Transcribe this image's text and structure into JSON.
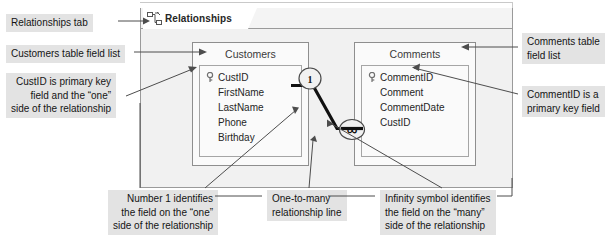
{
  "window": {
    "tab": {
      "label": "Relationships",
      "icon": "relationships-icon"
    }
  },
  "tables": [
    {
      "name": "Customers",
      "fields": [
        {
          "label": "CustID",
          "primary_key": true
        },
        {
          "label": "FirstName",
          "primary_key": false
        },
        {
          "label": "LastName",
          "primary_key": false
        },
        {
          "label": "Phone",
          "primary_key": false
        },
        {
          "label": "Birthday",
          "primary_key": false
        }
      ]
    },
    {
      "name": "Comments",
      "fields": [
        {
          "label": "CommentID",
          "primary_key": true
        },
        {
          "label": "Comment",
          "primary_key": false
        },
        {
          "label": "CommentDate",
          "primary_key": false
        },
        {
          "label": "CustID",
          "primary_key": false
        }
      ]
    }
  ],
  "relationship": {
    "one_symbol": "1",
    "many_symbol": "∞"
  },
  "callouts": {
    "relationships_tab": "Relationships tab",
    "customers_field_list": "Customers table field list",
    "custid_primary_key": "CustID is primary key\nfield and the “one”\nside of the relationship",
    "comments_field_list": "Comments table\nfield list",
    "commentid_primary_key": "CommentID is a\nprimary key field",
    "number_one": "Number 1 identifies\nthe field on the “one”\nside of the relationship",
    "one_to_many": "One-to-many\nrelationship line",
    "infinity_symbol": "Infinity symbol identifies\nthe field on the “many”\nside of the relationship"
  },
  "colors": {
    "callout_bg": "#e3e3e3",
    "canvas_bg": "#f1f1f1",
    "window_border": "#9a9a9a",
    "line": "#111111"
  }
}
